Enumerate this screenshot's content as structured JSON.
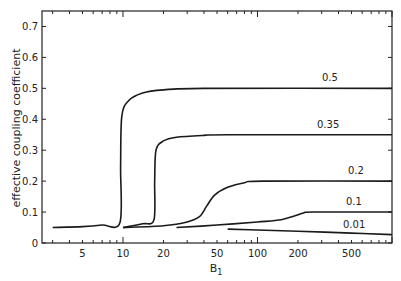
{
  "chart_data": {
    "type": "line",
    "title": "",
    "xlabel": "B1",
    "xlabel_main": "B",
    "xlabel_sub": "1",
    "ylabel": "effective coupling coefficient",
    "xscale": "log",
    "xlim": [
      2.5,
      1000
    ],
    "ylim": [
      0,
      0.75
    ],
    "grid": false,
    "legend": "inline labels at right end of curves",
    "x_ticks": [
      5,
      10,
      20,
      50,
      100,
      200,
      500
    ],
    "x_tick_labels": [
      "5",
      "10",
      "20",
      "50",
      "100",
      "200",
      "500"
    ],
    "y_ticks": [
      0,
      0.1,
      0.2,
      0.3,
      0.4,
      0.5,
      0.6,
      0.7
    ],
    "y_tick_labels": [
      "0",
      "0.1",
      "0.2",
      "0.3",
      "0.4",
      "0.5",
      "0.6",
      "0.7"
    ],
    "series": [
      {
        "name": "0.5",
        "points": [
          [
            3,
            0.05
          ],
          [
            5,
            0.053
          ],
          [
            7,
            0.058
          ],
          [
            9.5,
            0.066
          ],
          [
            9.6,
            0.25
          ],
          [
            9.8,
            0.41
          ],
          [
            11,
            0.46
          ],
          [
            14,
            0.485
          ],
          [
            20,
            0.495
          ],
          [
            40,
            0.5
          ],
          [
            1000,
            0.5
          ]
        ]
      },
      {
        "name": "0.35",
        "points": [
          [
            10,
            0.05
          ],
          [
            14,
            0.062
          ],
          [
            17,
            0.075
          ],
          [
            17.2,
            0.2
          ],
          [
            17.6,
            0.3
          ],
          [
            20,
            0.33
          ],
          [
            25,
            0.342
          ],
          [
            40,
            0.348
          ],
          [
            60,
            0.35
          ],
          [
            1000,
            0.35
          ]
        ]
      },
      {
        "name": "0.2",
        "points": [
          [
            10,
            0.05
          ],
          [
            20,
            0.056
          ],
          [
            30,
            0.068
          ],
          [
            37,
            0.085
          ],
          [
            42,
            0.12
          ],
          [
            48,
            0.155
          ],
          [
            60,
            0.18
          ],
          [
            80,
            0.195
          ],
          [
            110,
            0.2
          ],
          [
            1000,
            0.2
          ]
        ]
      },
      {
        "name": "0.1",
        "points": [
          [
            25,
            0.05
          ],
          [
            50,
            0.058
          ],
          [
            100,
            0.068
          ],
          [
            150,
            0.075
          ],
          [
            190,
            0.088
          ],
          [
            220,
            0.097
          ],
          [
            260,
            0.1
          ],
          [
            1000,
            0.1
          ]
        ]
      },
      {
        "name": "0.01",
        "points": [
          [
            60,
            0.045
          ],
          [
            100,
            0.042
          ],
          [
            200,
            0.038
          ],
          [
            500,
            0.032
          ],
          [
            1000,
            0.027
          ]
        ]
      }
    ]
  },
  "labels": {
    "ylabel": "effective coupling coefficient",
    "series_labels": [
      "0.5",
      "0.35",
      "0.2",
      "0.1",
      "0.01"
    ]
  }
}
